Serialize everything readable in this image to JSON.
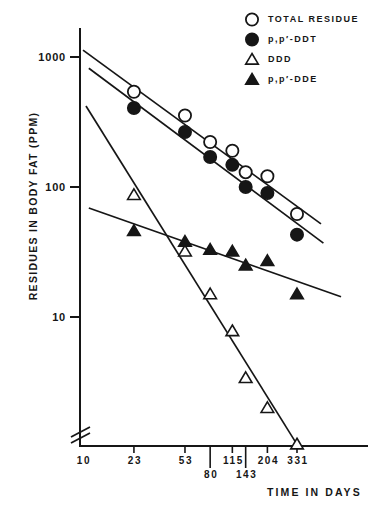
{
  "figure": {
    "background": "#ffffff",
    "ink_color": "#161616"
  },
  "chart_data": {
    "type": "scatter",
    "title": "",
    "xlabel": "TIME IN DAYS",
    "ylabel": "RESIDUES IN BODY FAT (PPM)",
    "x_scale": "log",
    "y_scale": "log",
    "xlim": [
      10,
      1040
    ],
    "ylim": [
      1,
      1670
    ],
    "x_ticks": [
      10,
      23,
      53,
      80,
      115,
      143,
      204,
      331
    ],
    "x_ticks_lower_row": [
      80,
      143
    ],
    "y_ticks": [
      1000,
      100,
      10
    ],
    "y_axis_break": true,
    "grid": false,
    "legend_position": "top-right",
    "x": [
      23,
      53,
      80,
      115,
      143,
      204,
      331
    ],
    "series": [
      {
        "name": "TOTAL RESIDUE",
        "marker": "circle-open",
        "values": [
          540,
          355,
          222,
          190,
          130,
          121,
          62
        ],
        "trend_line": {
          "x": [
            10,
            490
          ],
          "y": [
            1130,
            52
          ]
        }
      },
      {
        "name": "p,p′-DDT",
        "marker": "circle-filled",
        "values": [
          405,
          265,
          170,
          148,
          100,
          90,
          43
        ],
        "trend_line": {
          "x": [
            11,
            510
          ],
          "y": [
            820,
            37
          ]
        }
      },
      {
        "name": "DDD",
        "marker": "triangle-open",
        "values": [
          87,
          32,
          15,
          7.8,
          3.4,
          2.0,
          1.05
        ],
        "trend_line": {
          "x": [
            10.5,
            336
          ],
          "y": [
            420,
            1.02
          ]
        }
      },
      {
        "name": "p,p′-DDE",
        "marker": "triangle-filled",
        "values": [
          46,
          38,
          33,
          32,
          25,
          27,
          15
        ],
        "trend_line": {
          "x": [
            11,
            680
          ],
          "y": [
            69,
            14.3
          ]
        }
      }
    ]
  },
  "legend": {
    "items": [
      {
        "marker": "circle-open",
        "label": "TOTAL RESIDUE"
      },
      {
        "marker": "circle-filled",
        "label": "p,p′-DDT"
      },
      {
        "marker": "triangle-open",
        "label": "DDD"
      },
      {
        "marker": "triangle-filled",
        "label": "p,p′-DDE"
      }
    ]
  }
}
